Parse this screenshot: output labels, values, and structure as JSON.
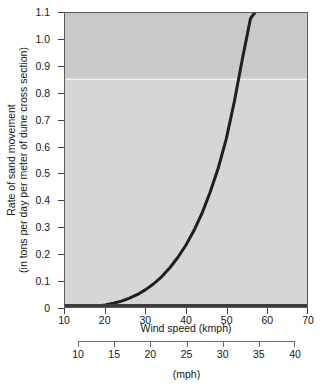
{
  "chart_data": {
    "type": "line",
    "title": "",
    "xlabel": "Wind speed (kmph)",
    "ylabel_line1": "Rate of sand movement",
    "ylabel_line2": "(in tons per day per meter of dune cross section)",
    "secondary_xlabel": "(mph)",
    "xlim": [
      10,
      70
    ],
    "ylim": [
      0,
      1.1
    ],
    "secondary_xlim": [
      10,
      40
    ],
    "grid": false,
    "legend": "none",
    "xticks": [
      "10",
      "20",
      "30",
      "40",
      "50",
      "60",
      "70"
    ],
    "xtick_values": [
      10,
      20,
      30,
      40,
      50,
      60,
      70
    ],
    "yticks": [
      "0",
      "0.1",
      "0.2",
      "0.3",
      "0.4",
      "0.5",
      "0.6",
      "0.7",
      "0.8",
      "0.9",
      "1.0",
      "1.1"
    ],
    "ytick_values": [
      0,
      0.1,
      0.2,
      0.3,
      0.4,
      0.5,
      0.6,
      0.7,
      0.8,
      0.9,
      1.0,
      1.1
    ],
    "secondary_xticks": [
      "10",
      "15",
      "20",
      "25",
      "30",
      "35",
      "40"
    ],
    "secondary_xtick_values": [
      10,
      15,
      20,
      25,
      30,
      35,
      40
    ],
    "series": [
      {
        "name": "Rate of sand movement",
        "color": "#1f1f1f",
        "x": [
          10,
          12,
          14,
          16,
          18,
          20,
          22,
          24,
          26,
          28,
          30,
          32,
          34,
          36,
          38,
          40,
          42,
          44,
          46,
          48,
          50,
          52,
          54,
          56,
          57
        ],
        "values": [
          0.0,
          0.0,
          0.0,
          0.002,
          0.004,
          0.008,
          0.014,
          0.022,
          0.033,
          0.047,
          0.065,
          0.087,
          0.114,
          0.147,
          0.186,
          0.232,
          0.287,
          0.352,
          0.43,
          0.52,
          0.63,
          0.77,
          0.93,
          1.08,
          1.1
        ]
      }
    ],
    "annotations": [
      {
        "name": "shading-boundary-rule",
        "type": "horizontal-rule",
        "y": 0.855,
        "color": "#f2f2f2"
      }
    ],
    "plot_bg_upper": "#c9c9c9",
    "plot_bg_lower": "#d6d6d6",
    "frame_color": "#5a5a5a"
  }
}
